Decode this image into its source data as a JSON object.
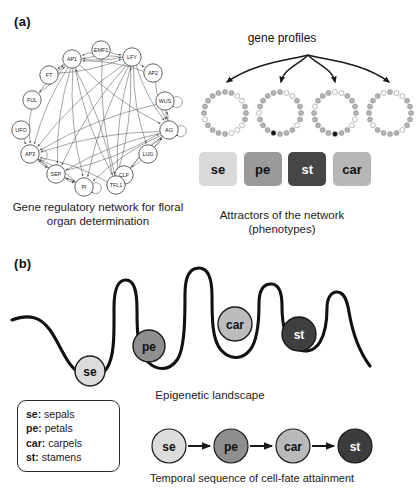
{
  "figure": {
    "panel_a_label": "(a)",
    "panel_b_label": "(b)"
  },
  "network": {
    "caption": "Gene regulatory network for floral organ determination",
    "nodes": [
      {
        "id": "AP1",
        "label": "AP1",
        "x": 64,
        "y": 31
      },
      {
        "id": "EMF1",
        "label": "EMF1",
        "x": 93,
        "y": 22
      },
      {
        "id": "LFY",
        "label": "LFY",
        "x": 124,
        "y": 29
      },
      {
        "id": "FT",
        "label": "FT",
        "x": 41,
        "y": 47
      },
      {
        "id": "AP2",
        "label": "AP2",
        "x": 145,
        "y": 45
      },
      {
        "id": "FUL",
        "label": "FUL",
        "x": 24,
        "y": 72
      },
      {
        "id": "WUS",
        "label": "WUS",
        "x": 157,
        "y": 73
      },
      {
        "id": "UFO",
        "label": "UFO",
        "x": 13,
        "y": 102
      },
      {
        "id": "AG",
        "label": "AG",
        "x": 161,
        "y": 102
      },
      {
        "id": "AP3",
        "label": "AP3",
        "x": 22,
        "y": 126
      },
      {
        "id": "LUG",
        "label": "LUG",
        "x": 140,
        "y": 126
      },
      {
        "id": "SEP",
        "label": "SEP",
        "x": 48,
        "y": 146
      },
      {
        "id": "CLF",
        "label": "CLF",
        "x": 116,
        "y": 147
      },
      {
        "id": "PI",
        "label": "PI",
        "x": 76,
        "y": 159
      },
      {
        "id": "TFL1",
        "label": "TFL1",
        "x": 108,
        "y": 157
      }
    ],
    "edges": [
      [
        "EMF1",
        "LFY"
      ],
      [
        "EMF1",
        "AP1"
      ],
      [
        "LFY",
        "AP1"
      ],
      [
        "AP1",
        "LFY"
      ],
      [
        "FT",
        "AP1"
      ],
      [
        "FUL",
        "AP1"
      ],
      [
        "AP1",
        "FT"
      ],
      [
        "AP1",
        "FUL"
      ],
      [
        "LFY",
        "AP2"
      ],
      [
        "AP2",
        "AG"
      ],
      [
        "WUS",
        "AG"
      ],
      [
        "AG",
        "WUS"
      ],
      [
        "UFO",
        "AP3"
      ],
      [
        "LFY",
        "AP3"
      ],
      [
        "AP1",
        "AP3"
      ],
      [
        "AG",
        "AP3"
      ],
      [
        "SEP",
        "AP3"
      ],
      [
        "AP3",
        "PI"
      ],
      [
        "PI",
        "AP3"
      ],
      [
        "LFY",
        "PI"
      ],
      [
        "AP1",
        "PI"
      ],
      [
        "AG",
        "PI"
      ],
      [
        "SEP",
        "PI"
      ],
      [
        "LFY",
        "SEP"
      ],
      [
        "AP1",
        "SEP"
      ],
      [
        "AG",
        "SEP"
      ],
      [
        "LFY",
        "TFL1"
      ],
      [
        "AP1",
        "TFL1"
      ],
      [
        "EMF1",
        "TFL1"
      ],
      [
        "TFL1",
        "LFY"
      ],
      [
        "TFL1",
        "AP1"
      ],
      [
        "LUG",
        "AG"
      ],
      [
        "CLF",
        "AG"
      ],
      [
        "AG",
        "TFL1"
      ],
      [
        "LFY",
        "AG"
      ],
      [
        "AP1",
        "AG"
      ],
      [
        "AP2",
        "AP1"
      ],
      [
        "FUL",
        "AP3"
      ],
      [
        "FT",
        "LFY"
      ],
      [
        "WUS",
        "AP3"
      ],
      [
        "SEP",
        "AG"
      ],
      [
        "AP3",
        "SEP"
      ],
      [
        "TFL1",
        "AP3"
      ],
      [
        "PI",
        "SEP"
      ],
      [
        "LFY",
        "LUG"
      ],
      [
        "AG",
        "CLF"
      ]
    ],
    "self_loops": [
      "WUS",
      "AG",
      "AP3",
      "PI"
    ]
  },
  "attractors": {
    "title": "gene profiles",
    "caption": "Attractors of the network (phenotypes)",
    "rings": [
      {
        "name": "sepal-profile",
        "cx": 29,
        "cy": 83,
        "dots": [
          "g",
          "g",
          "w",
          "w",
          "g",
          "g",
          "g",
          "w",
          "w",
          "w",
          "g",
          "g",
          "g",
          "g",
          "w",
          "g",
          "g",
          "g",
          "g",
          "g"
        ]
      },
      {
        "name": "petal-profile",
        "cx": 84,
        "cy": 83,
        "dots": [
          "g",
          "w",
          "w",
          "g",
          "g",
          "g",
          "g",
          "w",
          "g",
          "g",
          "g",
          "b",
          "g",
          "g",
          "g",
          "w",
          "g",
          "g",
          "g",
          "g"
        ]
      },
      {
        "name": "stamen-profile",
        "cx": 139,
        "cy": 83,
        "dots": [
          "w",
          "w",
          "g",
          "g",
          "g",
          "g",
          "w",
          "w",
          "g",
          "g",
          "b",
          "g",
          "g",
          "g",
          "g",
          "g",
          "w",
          "g",
          "g",
          "g"
        ]
      },
      {
        "name": "carpel-profile",
        "cx": 194,
        "cy": 83,
        "dots": [
          "g",
          "w",
          "w",
          "g",
          "g",
          "g",
          "g",
          "g",
          "w",
          "g",
          "g",
          "g",
          "g",
          "w",
          "g",
          "g",
          "g",
          "g",
          "g",
          "w"
        ]
      }
    ],
    "dot_colors": {
      "g": "#b4b4b4",
      "w": "#ffffff",
      "b": "#111111"
    },
    "phenotypes": [
      {
        "id": "se",
        "label": "se",
        "color": "#d9d9d9",
        "text_color": "#111111"
      },
      {
        "id": "pe",
        "label": "pe",
        "color": "#9a9a9a",
        "text_color": "#111111"
      },
      {
        "id": "st",
        "label": "st",
        "color": "#464646",
        "text_color": "#ffffff"
      },
      {
        "id": "car",
        "label": "car",
        "color": "#b6b6b6",
        "text_color": "#111111"
      }
    ]
  },
  "landscape": {
    "caption": "Epigenetic landscape",
    "curve": "M 6,52 C 22,46 34,48 44,62 C 54,76 60,96 72,104 C 82,111 94,110 101,100 C 109,88 108,62 108,40 C 108,20 112,12 120,12 C 128,12 131,22 131,42 C 131,62 131,84 142,94 C 151,103 163,103 171,92 C 179,81 179,48 179,26 C 179,6 185,0 193,0 C 201,0 206,8 206,28 C 206,50 206,72 215,82 C 224,92 236,92 244,82 C 252,72 253,48 253,36 C 253,22 258,16 265,16 C 272,16 276,24 276,38 C 276,54 278,70 288,78 C 297,86 308,84 314,74 C 320,64 321,48 321,40 C 321,30 325,24 331,24 C 338,24 341,32 343,44 C 346,62 352,82 364,98",
    "balls": [
      {
        "id": "se",
        "label": "se",
        "cx": 84,
        "cy": 103,
        "r": 15,
        "color": "#dcdcdc",
        "text_color": "#111111"
      },
      {
        "id": "pe",
        "label": "pe",
        "cx": 143,
        "cy": 78,
        "r": 16,
        "color": "#8f8f8f",
        "text_color": "#111111"
      },
      {
        "id": "car",
        "label": "car",
        "cx": 229,
        "cy": 56,
        "r": 17,
        "color": "#bcbcbc",
        "text_color": "#111111"
      },
      {
        "id": "st",
        "label": "st",
        "cx": 293,
        "cy": 66,
        "r": 17,
        "color": "#3f3f3f",
        "text_color": "#ffffff"
      }
    ]
  },
  "legend": {
    "rows": [
      {
        "abbr": "se:",
        "term": "sepals"
      },
      {
        "abbr": "pe:",
        "term": "petals"
      },
      {
        "abbr": "car:",
        "term": "carpels"
      },
      {
        "abbr": "st:",
        "term": "stamens"
      }
    ]
  },
  "sequence": {
    "caption": "Temporal sequence of cell-fate attainment",
    "steps": [
      {
        "id": "se",
        "label": "se",
        "cx": 19,
        "cy": 22,
        "r": 17,
        "color": "#dcdcdc",
        "text_color": "#111111"
      },
      {
        "id": "pe",
        "label": "pe",
        "cx": 81,
        "cy": 22,
        "r": 17,
        "color": "#8f8f8f",
        "text_color": "#111111"
      },
      {
        "id": "car",
        "label": "car",
        "cx": 143,
        "cy": 22,
        "r": 17,
        "color": "#b9b9b9",
        "text_color": "#111111"
      },
      {
        "id": "st",
        "label": "st",
        "cx": 205,
        "cy": 22,
        "r": 17,
        "color": "#3c3c3c",
        "text_color": "#ffffff"
      }
    ]
  }
}
